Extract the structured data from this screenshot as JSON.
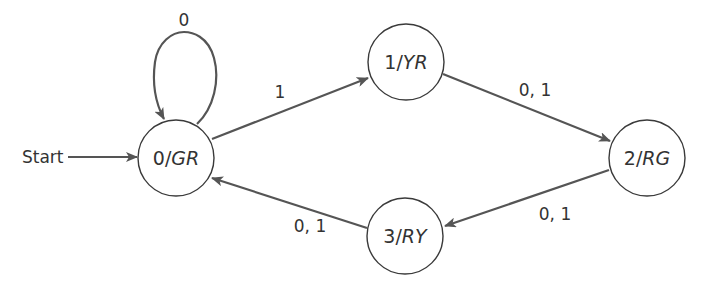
{
  "diagram": {
    "type": "finite-state-machine",
    "start_label": "Start",
    "colors": {
      "background": "#ffffff",
      "edge": "#555555",
      "state_stroke": "#3a3a3a",
      "text": "#333333"
    },
    "states": [
      {
        "id": "s0",
        "number": "0",
        "output": "GR",
        "cx": 176,
        "cy": 158,
        "r": 38
      },
      {
        "id": "s1",
        "number": "1",
        "output": "YR",
        "cx": 406,
        "cy": 62,
        "r": 38
      },
      {
        "id": "s2",
        "number": "2",
        "output": "RG",
        "cx": 647,
        "cy": 158,
        "r": 38
      },
      {
        "id": "s3",
        "number": "3",
        "output": "RY",
        "cx": 405,
        "cy": 236,
        "r": 38
      }
    ],
    "transitions": [
      {
        "from": "0",
        "to": "0",
        "label": "0"
      },
      {
        "from": "0",
        "to": "1",
        "label": "1"
      },
      {
        "from": "1",
        "to": "2",
        "label": "0, 1"
      },
      {
        "from": "2",
        "to": "3",
        "label": "0, 1"
      },
      {
        "from": "3",
        "to": "0",
        "label": "0, 1"
      }
    ],
    "initial_state": "0"
  }
}
